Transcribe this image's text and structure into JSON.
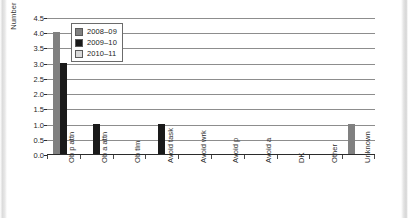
{
  "chart_data": {
    "type": "bar",
    "title": "",
    "xlabel": "",
    "ylabel": "Number of Referrals",
    "ylim": [
      0,
      4.5
    ],
    "ytick_labels": [
      "4.5",
      "4.0",
      "3.5",
      "3.0",
      "2.5",
      "2.0",
      "1.5",
      "1.0",
      "0.5",
      "0.0"
    ],
    "ytick_values": [
      4.5,
      4.0,
      3.5,
      3.0,
      2.5,
      2.0,
      1.5,
      1.0,
      0.5,
      0.0
    ],
    "grid": true,
    "legend_position": "upper-left-inside",
    "categories": [
      "Ob p attn",
      "Ob a attn",
      "Ob tlm",
      "Avoid task",
      "Avoid wrk",
      "Avoid p",
      "Avoid a",
      "DK",
      "Other",
      "Unknown"
    ],
    "series": [
      {
        "name": "2008–09",
        "color": "#808080",
        "values": [
          4.0,
          0,
          0,
          0,
          0,
          0,
          0,
          0,
          0,
          1.0
        ]
      },
      {
        "name": "2009–10",
        "color": "#1a1a1a",
        "values": [
          3.0,
          1.0,
          0,
          1.0,
          0,
          0,
          0,
          0,
          0,
          0
        ]
      },
      {
        "name": "2010–11",
        "color": "#d9d9d9",
        "values": [
          0,
          0,
          0,
          0,
          0,
          0,
          0,
          0,
          0,
          0
        ]
      }
    ]
  },
  "legend": {
    "items": [
      {
        "label": "2008–09",
        "color": "#808080"
      },
      {
        "label": "2009–10",
        "color": "#1a1a1a"
      },
      {
        "label": "2010–11",
        "color": "#d9d9d9"
      }
    ]
  }
}
